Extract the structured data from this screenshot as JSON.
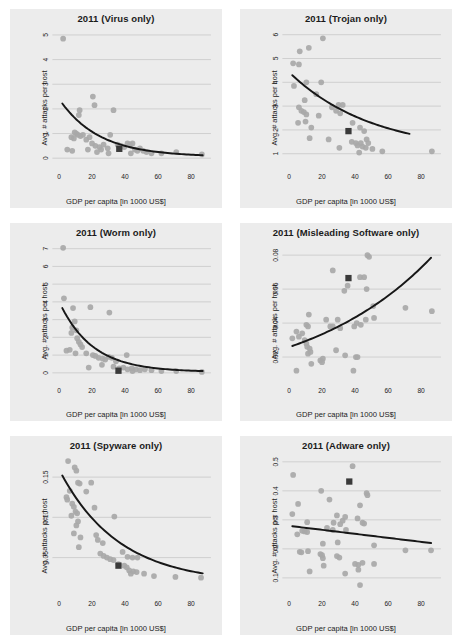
{
  "figure": {
    "panel_background": "#ececec",
    "point_color": "#a8a8a8",
    "line_color": "#171717",
    "marker_color": "#3a3a3a",
    "grid_color": "#b9b9b9"
  },
  "chart_data": [
    {
      "type": "scatter",
      "title": "2011 (Virus only)",
      "xlabel": "GDP per capita [in 1000 US$]",
      "ylabel": "Avg. # attacks per host",
      "xlim": [
        -4,
        92
      ],
      "ylim": [
        -0.35,
        5.3
      ],
      "xticks": [
        0,
        20,
        40,
        60,
        80
      ],
      "yticks": [
        0,
        1,
        2,
        3,
        4,
        5
      ],
      "grid": true,
      "legend": "none",
      "points": [
        [
          2.5,
          4.85
        ],
        [
          20.5,
          2.5
        ],
        [
          21.5,
          2.15
        ],
        [
          12.5,
          1.95
        ],
        [
          12.0,
          1.75
        ],
        [
          33.0,
          1.95
        ],
        [
          9.5,
          1.05
        ],
        [
          10.5,
          1.0
        ],
        [
          11.5,
          0.95
        ],
        [
          13.0,
          0.9
        ],
        [
          7.5,
          0.85
        ],
        [
          9.0,
          0.8
        ],
        [
          14.5,
          0.95
        ],
        [
          16.5,
          0.75
        ],
        [
          18.5,
          0.85
        ],
        [
          20.0,
          0.6
        ],
        [
          22.0,
          0.5
        ],
        [
          24.5,
          0.45
        ],
        [
          25.5,
          0.35
        ],
        [
          27.0,
          0.55
        ],
        [
          29.5,
          0.4
        ],
        [
          31.0,
          0.95
        ],
        [
          35.5,
          0.55
        ],
        [
          37.5,
          0.5
        ],
        [
          39.5,
          0.45
        ],
        [
          41.5,
          0.6
        ],
        [
          43.0,
          0.55
        ],
        [
          44.5,
          0.6
        ],
        [
          46.0,
          0.35
        ],
        [
          47.5,
          0.3
        ],
        [
          49.0,
          0.4
        ],
        [
          51.0,
          0.3
        ],
        [
          53.0,
          0.25
        ],
        [
          56.0,
          0.2
        ],
        [
          62.0,
          0.2
        ],
        [
          71.0,
          0.25
        ],
        [
          86.5,
          0.15
        ],
        [
          5.0,
          0.35
        ],
        [
          8.0,
          0.3
        ],
        [
          17.5,
          0.35
        ],
        [
          23.0,
          0.25
        ],
        [
          30.0,
          0.2
        ],
        [
          43.5,
          0.2
        ]
      ],
      "highlight_point": [
        36.5,
        0.38
      ],
      "trend": {
        "kind": "power-decay",
        "x0": 2.0,
        "y0": 2.22,
        "x1": 87.0,
        "y1": 0.06,
        "rate": 0.042
      }
    },
    {
      "type": "scatter",
      "title": "2011 (Trojan only)",
      "xlabel": "GDP per capita [in 1000 US$]",
      "ylabel": "Avg. # attacks per host",
      "xlim": [
        -4,
        92
      ],
      "ylim": [
        0.45,
        6.3
      ],
      "xticks": [
        0,
        20,
        40,
        60,
        80
      ],
      "yticks": [
        1,
        2,
        3,
        4,
        5,
        6
      ],
      "grid": true,
      "legend": "none",
      "points": [
        [
          20.5,
          5.85
        ],
        [
          12.0,
          5.45
        ],
        [
          6.5,
          5.3
        ],
        [
          2.5,
          4.8
        ],
        [
          6.0,
          4.75
        ],
        [
          10.5,
          4.0
        ],
        [
          19.5,
          4.0
        ],
        [
          3.0,
          3.85
        ],
        [
          16.5,
          3.5
        ],
        [
          9.5,
          3.25
        ],
        [
          6.0,
          2.95
        ],
        [
          7.5,
          2.8
        ],
        [
          9.0,
          2.75
        ],
        [
          10.5,
          2.65
        ],
        [
          26.0,
          2.95
        ],
        [
          30.0,
          3.05
        ],
        [
          32.5,
          3.05
        ],
        [
          28.5,
          2.8
        ],
        [
          31.0,
          2.7
        ],
        [
          18.0,
          2.6
        ],
        [
          5.5,
          2.3
        ],
        [
          10.0,
          2.35
        ],
        [
          13.5,
          2.1
        ],
        [
          38.5,
          2.3
        ],
        [
          43.0,
          2.1
        ],
        [
          45.5,
          1.95
        ],
        [
          47.0,
          1.6
        ],
        [
          12.5,
          1.65
        ],
        [
          24.0,
          1.6
        ],
        [
          30.5,
          1.25
        ],
        [
          38.0,
          1.5
        ],
        [
          40.5,
          1.45
        ],
        [
          41.5,
          1.35
        ],
        [
          43.5,
          1.45
        ],
        [
          44.5,
          1.3
        ],
        [
          46.5,
          1.25
        ],
        [
          48.0,
          1.45
        ],
        [
          50.5,
          1.2
        ],
        [
          56.5,
          1.1
        ],
        [
          86.5,
          1.1
        ],
        [
          42.5,
          1.05
        ]
      ],
      "highlight_point": [
        36.0,
        1.95
      ],
      "trend": {
        "kind": "power-decay",
        "x0": 2.0,
        "y0": 4.3,
        "x1": 73.0,
        "y1": 1.05,
        "rate": 0.02
      }
    },
    {
      "type": "scatter",
      "title": "2011 (Worm only)",
      "xlabel": "GDP per capita [in 1000 US$]",
      "ylabel": "Avg. # attacks per host",
      "xlim": [
        -4,
        92
      ],
      "ylim": [
        -0.45,
        7.4
      ],
      "xticks": [
        0,
        20,
        40,
        60,
        80
      ],
      "yticks": [
        0,
        1,
        2,
        3,
        4,
        5,
        6,
        7
      ],
      "grid": true,
      "legend": "none",
      "points": [
        [
          2.5,
          7.05
        ],
        [
          3.0,
          4.2
        ],
        [
          8.5,
          3.65
        ],
        [
          19.0,
          3.7
        ],
        [
          30.5,
          3.4
        ],
        [
          9.5,
          2.9
        ],
        [
          8.0,
          2.55
        ],
        [
          10.5,
          2.4
        ],
        [
          7.5,
          2.25
        ],
        [
          11.0,
          1.95
        ],
        [
          12.0,
          1.75
        ],
        [
          13.0,
          1.6
        ],
        [
          14.0,
          1.45
        ],
        [
          6.5,
          1.3
        ],
        [
          4.5,
          1.25
        ],
        [
          10.0,
          1.1
        ],
        [
          16.5,
          1.1
        ],
        [
          20.5,
          1.0
        ],
        [
          22.0,
          0.95
        ],
        [
          24.0,
          0.85
        ],
        [
          26.5,
          0.8
        ],
        [
          28.0,
          0.75
        ],
        [
          30.0,
          0.9
        ],
        [
          32.0,
          0.85
        ],
        [
          34.5,
          0.65
        ],
        [
          41.0,
          1.0
        ],
        [
          18.0,
          0.3
        ],
        [
          26.0,
          0.45
        ],
        [
          33.0,
          0.35
        ],
        [
          36.5,
          0.25
        ],
        [
          39.0,
          0.3
        ],
        [
          41.5,
          0.2
        ],
        [
          44.0,
          0.25
        ],
        [
          46.5,
          0.2
        ],
        [
          49.0,
          0.15
        ],
        [
          52.0,
          0.2
        ],
        [
          56.0,
          0.15
        ],
        [
          62.0,
          0.1
        ],
        [
          71.0,
          0.1
        ],
        [
          86.5,
          0.05
        ],
        [
          44.5,
          0.1
        ]
      ],
      "highlight_point": [
        36.0,
        0.12
      ],
      "trend": {
        "kind": "power-decay",
        "x0": 2.0,
        "y0": 3.65,
        "x1": 87.0,
        "y1": 0.05,
        "rate": 0.05
      }
    },
    {
      "type": "scatter",
      "title": "2011 (Misleading Software only)",
      "xlabel": "GDP per capita [in 1000 US$]",
      "ylabel": "Avg. # attacks per host",
      "xlim": [
        -4,
        92
      ],
      "ylim": [
        0.006,
        0.088
      ],
      "xticks": [
        0,
        20,
        40,
        60,
        80
      ],
      "yticks": [
        0.02,
        0.04,
        0.06,
        0.08
      ],
      "ytick_labels": [
        "0.02",
        "0.04",
        "0.06",
        "0.08"
      ],
      "grid": true,
      "legend": "none",
      "points": [
        [
          47.5,
          0.08
        ],
        [
          48.5,
          0.079
        ],
        [
          26.5,
          0.071
        ],
        [
          43.0,
          0.067
        ],
        [
          45.5,
          0.067
        ],
        [
          35.5,
          0.062
        ],
        [
          47.0,
          0.06
        ],
        [
          33.5,
          0.059
        ],
        [
          12.0,
          0.045
        ],
        [
          51.0,
          0.05
        ],
        [
          70.5,
          0.049
        ],
        [
          86.5,
          0.047
        ],
        [
          10.5,
          0.039
        ],
        [
          11.5,
          0.038
        ],
        [
          22.5,
          0.042
        ],
        [
          29.5,
          0.042
        ],
        [
          25.0,
          0.038
        ],
        [
          26.5,
          0.038
        ],
        [
          31.0,
          0.037
        ],
        [
          39.5,
          0.038
        ],
        [
          41.0,
          0.04
        ],
        [
          43.5,
          0.039
        ],
        [
          46.5,
          0.042
        ],
        [
          51.5,
          0.043
        ],
        [
          2.0,
          0.031
        ],
        [
          4.5,
          0.035
        ],
        [
          6.0,
          0.032
        ],
        [
          8.0,
          0.034
        ],
        [
          9.5,
          0.03
        ],
        [
          10.5,
          0.028
        ],
        [
          11.0,
          0.026
        ],
        [
          12.5,
          0.025
        ],
        [
          13.0,
          0.023
        ],
        [
          11.5,
          0.022
        ],
        [
          19.0,
          0.018
        ],
        [
          20.0,
          0.017
        ],
        [
          20.5,
          0.019
        ],
        [
          13.5,
          0.016
        ],
        [
          28.5,
          0.024
        ],
        [
          34.0,
          0.021
        ],
        [
          40.5,
          0.02
        ],
        [
          41.5,
          0.02
        ],
        [
          4.5,
          0.012
        ],
        [
          39.0,
          0.012
        ]
      ],
      "highlight_point": [
        36.0,
        0.0665
      ],
      "trend": {
        "kind": "growth",
        "x0": 2.0,
        "y0": 0.0265,
        "x1": 86.0,
        "y1": 0.0785
      }
    },
    {
      "type": "scatter",
      "title": "2011 (Spyware only)",
      "xlabel": "GDP per capita [in 1000 US$]",
      "ylabel": "Avg. # attacks per host",
      "xlim": [
        -4,
        92
      ],
      "ylim": [
        0.005,
        0.178
      ],
      "xticks": [
        0,
        20,
        40,
        60,
        80
      ],
      "yticks": [
        0.05,
        0.1,
        0.15
      ],
      "ytick_labels": [
        "0.05",
        "0.10",
        "0.15"
      ],
      "grid": true,
      "legend": "none",
      "points": [
        [
          5.5,
          0.17
        ],
        [
          9.5,
          0.162
        ],
        [
          10.5,
          0.158
        ],
        [
          11.5,
          0.143
        ],
        [
          12.5,
          0.142
        ],
        [
          19.5,
          0.143
        ],
        [
          6.5,
          0.133
        ],
        [
          4.5,
          0.125
        ],
        [
          16.5,
          0.132
        ],
        [
          8.0,
          0.117
        ],
        [
          9.0,
          0.113
        ],
        [
          10.0,
          0.107
        ],
        [
          11.0,
          0.105
        ],
        [
          21.5,
          0.112
        ],
        [
          5.0,
          0.122
        ],
        [
          7.5,
          0.102
        ],
        [
          11.5,
          0.095
        ],
        [
          10.5,
          0.09
        ],
        [
          33.5,
          0.101
        ],
        [
          9.0,
          0.08
        ],
        [
          13.0,
          0.075
        ],
        [
          22.5,
          0.078
        ],
        [
          23.5,
          0.072
        ],
        [
          26.5,
          0.068
        ],
        [
          12.0,
          0.063
        ],
        [
          25.0,
          0.055
        ],
        [
          27.0,
          0.052
        ],
        [
          29.0,
          0.05
        ],
        [
          31.0,
          0.048
        ],
        [
          33.0,
          0.047
        ],
        [
          38.5,
          0.057
        ],
        [
          41.5,
          0.051
        ],
        [
          44.5,
          0.05
        ],
        [
          47.5,
          0.05
        ],
        [
          36.0,
          0.042
        ],
        [
          39.5,
          0.04
        ],
        [
          41.0,
          0.038
        ],
        [
          42.5,
          0.034
        ],
        [
          43.5,
          0.03
        ],
        [
          45.0,
          0.033
        ],
        [
          47.0,
          0.032
        ],
        [
          51.5,
          0.03
        ],
        [
          57.5,
          0.027
        ],
        [
          70.5,
          0.026
        ],
        [
          86.0,
          0.025
        ]
      ],
      "highlight_point": [
        36.0,
        0.04
      ],
      "trend": {
        "kind": "power-decay",
        "x0": 2.0,
        "y0": 0.152,
        "x1": 87.0,
        "y1": 0.018,
        "rate": 0.028
      }
    },
    {
      "type": "scatter",
      "title": "2011 (Adware only)",
      "xlabel": "GDP per capita [in 1000 US$]",
      "ylabel": "Avg. # attacks per host",
      "xlim": [
        -4,
        92
      ],
      "ylim": [
        0.045,
        0.525
      ],
      "xticks": [
        0,
        20,
        40,
        60,
        80
      ],
      "yticks": [
        0.1,
        0.2,
        0.3,
        0.4,
        0.5
      ],
      "ytick_labels": [
        "0.1",
        "0.2",
        "0.3",
        "0.4",
        "0.5"
      ],
      "grid": true,
      "legend": "none",
      "points": [
        [
          38.5,
          0.485
        ],
        [
          2.5,
          0.455
        ],
        [
          19.5,
          0.4
        ],
        [
          47.0,
          0.392
        ],
        [
          47.5,
          0.385
        ],
        [
          24.5,
          0.37
        ],
        [
          5.5,
          0.355
        ],
        [
          43.0,
          0.35
        ],
        [
          2.0,
          0.32
        ],
        [
          29.0,
          0.315
        ],
        [
          34.0,
          0.31
        ],
        [
          41.5,
          0.305
        ],
        [
          11.0,
          0.292
        ],
        [
          27.0,
          0.29
        ],
        [
          31.0,
          0.285
        ],
        [
          32.5,
          0.297
        ],
        [
          44.5,
          0.29
        ],
        [
          45.5,
          0.287
        ],
        [
          23.0,
          0.272
        ],
        [
          26.5,
          0.265
        ],
        [
          5.0,
          0.25
        ],
        [
          8.0,
          0.262
        ],
        [
          9.5,
          0.26
        ],
        [
          11.0,
          0.258
        ],
        [
          34.5,
          0.265
        ],
        [
          20.5,
          0.218
        ],
        [
          29.5,
          0.222
        ],
        [
          51.5,
          0.212
        ],
        [
          70.5,
          0.195
        ],
        [
          86.0,
          0.195
        ],
        [
          6.5,
          0.19
        ],
        [
          7.5,
          0.188
        ],
        [
          11.5,
          0.192
        ],
        [
          19.0,
          0.182
        ],
        [
          20.0,
          0.178
        ],
        [
          20.5,
          0.168
        ],
        [
          29.0,
          0.175
        ],
        [
          30.5,
          0.17
        ],
        [
          40.0,
          0.148
        ],
        [
          42.0,
          0.145
        ],
        [
          44.5,
          0.152
        ],
        [
          51.5,
          0.148
        ],
        [
          12.5,
          0.122
        ],
        [
          21.0,
          0.142
        ],
        [
          34.0,
          0.115
        ],
        [
          42.0,
          0.128
        ],
        [
          43.0,
          0.075
        ]
      ],
      "highlight_point": [
        36.5,
        0.432
      ],
      "trend": {
        "kind": "linear",
        "x0": 2.0,
        "y0": 0.278,
        "x1": 86.0,
        "y1": 0.22
      }
    }
  ]
}
